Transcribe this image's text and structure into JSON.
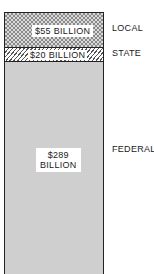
{
  "chart_data": {
    "type": "bar",
    "subtype": "stacked-single-column",
    "title": "",
    "xlabel": "",
    "ylabel": "",
    "categories": [
      "LOCAL",
      "STATE",
      "FEDERAL"
    ],
    "series": [
      {
        "name": "LOCAL",
        "value": 55,
        "label": "$55 BILLION",
        "pattern": "checkered"
      },
      {
        "name": "STATE",
        "value": 20,
        "label": "$20 BILLION",
        "pattern": "diagonal-hatch"
      },
      {
        "name": "FEDERAL",
        "value": 289,
        "label": "$289 BILLION",
        "pattern": "light-gray"
      }
    ],
    "values": [
      55,
      20,
      289
    ],
    "unit": "billion USD",
    "stack_order_top_to_bottom": [
      "LOCAL",
      "STATE",
      "FEDERAL"
    ],
    "legend_position": "right (inline labels)",
    "grid": false
  },
  "segments": {
    "local": {
      "value_label": "$55 BILLION",
      "name": "LOCAL"
    },
    "state": {
      "value_label": "$20 BILLION",
      "name": "STATE"
    },
    "federal": {
      "value_label_line1": "$289",
      "value_label_line2": "BILLION",
      "name": "FEDERAL"
    }
  }
}
